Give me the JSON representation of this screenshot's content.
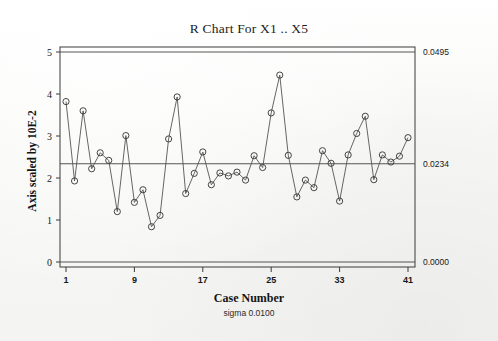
{
  "chart_data": {
    "type": "line",
    "title": "R Chart For X1 .. X5",
    "subtitle": "sigma 0.0100",
    "xlabel": "Case Number",
    "ylabel": "Axis scaled by 10E-2",
    "grid": false,
    "legend": null,
    "xlim": [
      0,
      42
    ],
    "ylim": [
      0,
      5.25
    ],
    "xticks": [
      "1",
      "9",
      "17",
      "25",
      "33",
      "41"
    ],
    "xtick_values": [
      1,
      9,
      17,
      25,
      33,
      41
    ],
    "yticks": [
      "0",
      "1",
      "2",
      "3",
      "4",
      "5"
    ],
    "ytick_values": [
      0,
      1,
      2,
      3,
      4,
      5
    ],
    "right_axis_labels": [
      {
        "text": "0.0495",
        "value": 5.0,
        "role": "upper-control-limit"
      },
      {
        "text": "0.0234",
        "value": 2.34,
        "role": "center-line"
      },
      {
        "text": "0.0000",
        "value": 0.0,
        "role": "lower-control-limit"
      }
    ],
    "control_limits": {
      "ucl": 5.0,
      "cl": 2.34,
      "lcl": 0.0,
      "ucl_display": "0.0495",
      "cl_display": "0.0234",
      "lcl_display": "0.0000"
    },
    "marker": "open-circle",
    "series": [
      {
        "name": "R",
        "x": [
          1,
          2,
          3,
          4,
          5,
          6,
          7,
          8,
          9,
          10,
          11,
          12,
          13,
          14,
          15,
          16,
          17,
          18,
          19,
          20,
          21,
          22,
          23,
          24,
          25,
          26,
          27,
          28,
          29,
          30,
          31,
          32,
          33,
          34,
          35,
          36,
          37,
          38,
          39,
          40,
          41
        ],
        "values": [
          3.82,
          1.93,
          3.6,
          2.22,
          2.6,
          2.42,
          1.2,
          3.01,
          1.42,
          1.72,
          0.84,
          1.11,
          2.93,
          3.93,
          1.63,
          2.11,
          2.62,
          1.84,
          2.12,
          2.05,
          2.14,
          1.95,
          2.53,
          2.25,
          3.55,
          4.45,
          2.54,
          1.55,
          1.95,
          1.77,
          2.65,
          2.35,
          1.45,
          2.55,
          3.06,
          3.47,
          1.96,
          2.55,
          2.38,
          2.52,
          2.96
        ]
      }
    ]
  }
}
